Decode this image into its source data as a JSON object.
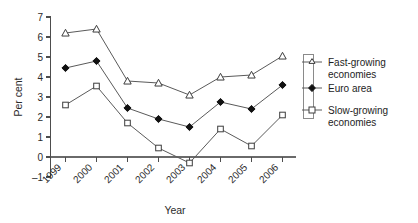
{
  "chart_data": {
    "type": "line",
    "title": "",
    "xlabel": "Year",
    "ylabel": "Per cent",
    "categories": [
      "1999",
      "2000",
      "2001",
      "2002",
      "2003",
      "2004",
      "2005",
      "2006"
    ],
    "x": [
      1999,
      2000,
      2001,
      2002,
      2003,
      2004,
      2005,
      2006
    ],
    "ylim": [
      -1,
      7
    ],
    "yticks": [
      -1,
      0,
      1,
      2,
      3,
      4,
      5,
      6,
      7
    ],
    "ytick_labels": [
      "–1",
      "0",
      "1",
      "2",
      "3",
      "4",
      "5",
      "6",
      "7"
    ],
    "grid": false,
    "legend_position": "right",
    "series": [
      {
        "name": "Fast-growing economies",
        "marker": "open-triangle",
        "values": [
          6.2,
          6.4,
          3.8,
          3.7,
          3.1,
          4.0,
          4.1,
          5.05
        ]
      },
      {
        "name": "Euro area",
        "marker": "filled-diamond",
        "values": [
          4.45,
          4.8,
          2.45,
          1.9,
          1.5,
          2.75,
          2.4,
          3.6
        ]
      },
      {
        "name": "Slow-growing economies",
        "marker": "open-square",
        "values": [
          2.6,
          3.55,
          1.7,
          0.45,
          -0.3,
          1.4,
          0.55,
          2.1
        ]
      }
    ]
  },
  "legend": {
    "entries": [
      {
        "label_line1": "Fast-growing",
        "label_line2": "economies"
      },
      {
        "label_line1": "Euro area",
        "label_line2": ""
      },
      {
        "label_line1": "Slow-growing",
        "label_line2": "economies"
      }
    ]
  },
  "axis": {
    "x_title": "Year",
    "y_title": "Per cent"
  },
  "colors": {
    "axis": "#4d4d4d",
    "line": "#5a5a5a",
    "marker_fill_open": "#ffffff",
    "marker_fill_solid": "#111111",
    "text": "#2b2b2b",
    "background": "#ffffff"
  }
}
